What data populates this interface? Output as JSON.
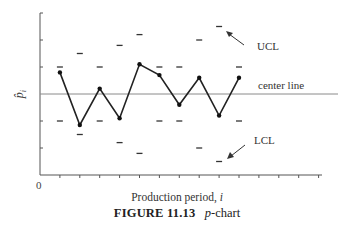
{
  "figure": {
    "number_label": "FIGURE 11.13",
    "title_label": "p-chart"
  },
  "axes": {
    "xlabel_text": "Production period, ",
    "xlabel_var": "i",
    "ylabel": "p̂i",
    "origin_label": "0"
  },
  "annotations": {
    "ucl": "UCL",
    "center": "center line",
    "lcl": "LCL"
  },
  "colors": {
    "axis": "#555555",
    "center_line": "#8a8a8a",
    "series": "#222222",
    "limits": "#333333"
  },
  "chart_data": {
    "type": "line",
    "xlabel": "Production period, i",
    "ylabel": "p̂i",
    "x_tick_labels": [
      "0"
    ],
    "y_tick_labels": [],
    "note": "y values expressed in tick units relative to center line (center line = 0); axis is unlabeled",
    "ylim": [
      -3,
      3
    ],
    "xlim": [
      0,
      16
    ],
    "grid": false,
    "center_line": 0,
    "x": [
      1,
      2,
      3,
      4,
      5,
      6,
      7,
      8,
      9,
      10
    ],
    "series": [
      {
        "name": "p̂i (sample proportion)",
        "values": [
          0.8,
          -1.15,
          0.2,
          -0.9,
          1.1,
          0.7,
          -0.4,
          0.6,
          -0.8,
          0.6
        ]
      },
      {
        "name": "UCL",
        "values": [
          1.0,
          1.5,
          1.0,
          1.8,
          2.2,
          1.0,
          1.0,
          2.0,
          2.5,
          1.0
        ]
      },
      {
        "name": "LCL",
        "values": [
          -1.0,
          -1.5,
          -1.0,
          -1.8,
          -2.2,
          -1.0,
          -1.0,
          -2.0,
          -2.5,
          -1.0
        ]
      }
    ]
  }
}
